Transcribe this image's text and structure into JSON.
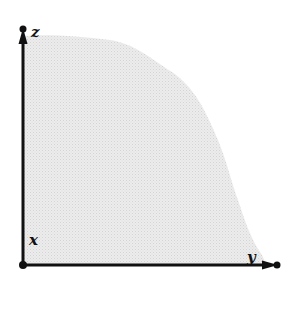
{
  "diagram": {
    "type": "3d-region-projection",
    "labels": {
      "z": "z",
      "x": "x",
      "y": "y"
    },
    "colors": {
      "axis": "#111111",
      "region_fill": "#e6e6e6",
      "background": "#ffffff"
    },
    "elements": [
      {
        "kind": "axis",
        "name": "vertical-axis",
        "label": "z",
        "direction": "up"
      },
      {
        "kind": "axis",
        "name": "horizontal-axis",
        "label": "y",
        "direction": "right"
      },
      {
        "kind": "point",
        "name": "origin",
        "label": "x"
      },
      {
        "kind": "region",
        "name": "shaded-region",
        "shape": "quarter-disk-like curved region"
      }
    ]
  }
}
